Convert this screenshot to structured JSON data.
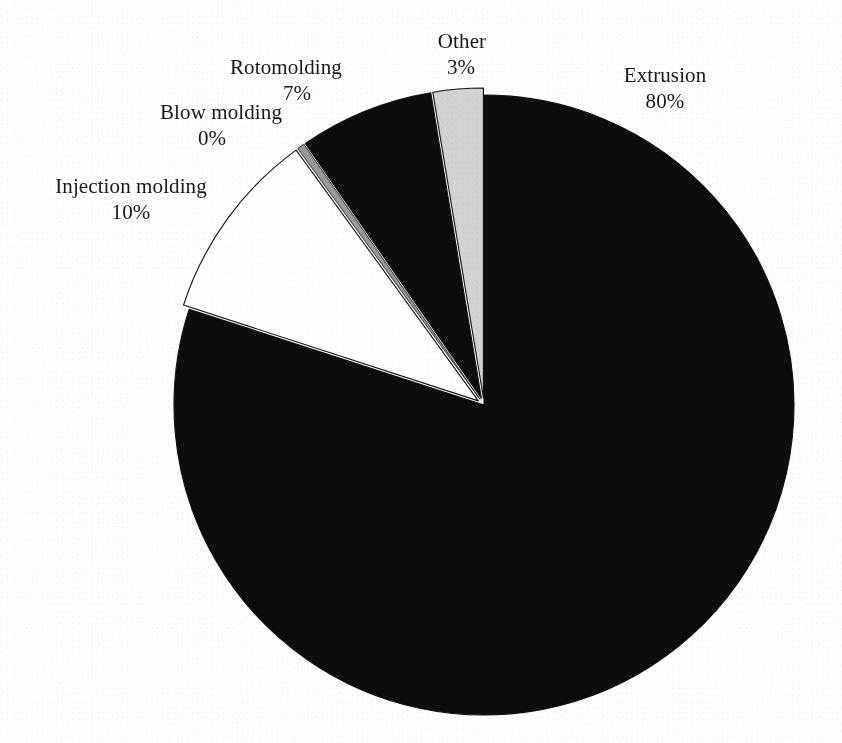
{
  "figure": {
    "background_color": "#fefefe",
    "text_color": "#16181a"
  },
  "chart_data": {
    "type": "pie",
    "title": "",
    "subtitle": "",
    "xlabel": "",
    "ylabel": "",
    "legend_position": "none",
    "labels_position": "outside",
    "start_angle_deg": 0,
    "direction": "clockwise",
    "center": {
      "x": 484,
      "y": 405
    },
    "radius": 310,
    "categories": [
      "Extrusion",
      "Injection molding",
      "Blow molding",
      "Rotomolding",
      "Other"
    ],
    "values": [
      80,
      10,
      0,
      7,
      3
    ],
    "value_suffix": "%",
    "colors": [
      "#0d0d0d",
      "#ffffff",
      "#9a9a9a",
      "#0d0d0d",
      "#d2d2d2"
    ],
    "exploded": [
      "Injection molding",
      "Blow molding",
      "Rotomolding",
      "Other"
    ],
    "slices": [
      {
        "name": "Extrusion",
        "value": 80,
        "value_label": "80%",
        "color": "#0d0d0d",
        "start_deg": 0,
        "end_deg": 288,
        "exploded": false,
        "explode_offset": 0
      },
      {
        "name": "Injection molding",
        "value": 10,
        "value_label": "10%",
        "color": "#ffffff",
        "start_deg": 288,
        "end_deg": 324,
        "exploded": true,
        "explode_offset": 7
      },
      {
        "name": "Blow molding",
        "value": 0,
        "value_label": "0%",
        "color": "#9a9a9a",
        "start_deg": 324,
        "end_deg": 325.4,
        "exploded": true,
        "explode_offset": 7
      },
      {
        "name": "Rotomolding",
        "value": 7,
        "value_label": "7%",
        "color": "#0d0d0d",
        "start_deg": 325.4,
        "end_deg": 350.6,
        "exploded": true,
        "explode_offset": 7
      },
      {
        "name": "Other",
        "value": 3,
        "value_label": "3%",
        "color": "#d2d2d2",
        "start_deg": 350.6,
        "end_deg": 360,
        "exploded": true,
        "explode_offset": 7
      }
    ]
  },
  "labels": {
    "other": {
      "name": "Other",
      "value": "3%"
    },
    "extrusion": {
      "name": "Extrusion",
      "value": "80%"
    },
    "rotomolding": {
      "name": "Rotomolding",
      "value": "7%"
    },
    "blow_molding": {
      "name": "Blow molding",
      "value": "0%"
    },
    "injection": {
      "name": "Injection molding",
      "value": "10%"
    }
  }
}
